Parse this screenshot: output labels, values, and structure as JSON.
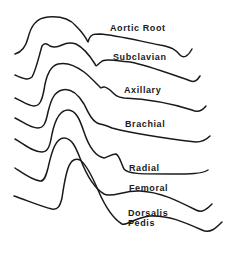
{
  "figure": {
    "stroke_color": "#1a1a1a",
    "background": "#ffffff",
    "waveforms": [
      {
        "name": "aortic-root",
        "label": "Aortic Root"
      },
      {
        "name": "subclavian",
        "label": "Subclavian"
      },
      {
        "name": "axillary",
        "label": "Axillary"
      },
      {
        "name": "brachial",
        "label": "Brachial"
      },
      {
        "name": "radial",
        "label": "Radial"
      },
      {
        "name": "femoral",
        "label": "Femoral"
      },
      {
        "name": "dorsalis-pedis",
        "label_line1": "Dorsalis",
        "label_line2": "Pedis"
      }
    ]
  }
}
